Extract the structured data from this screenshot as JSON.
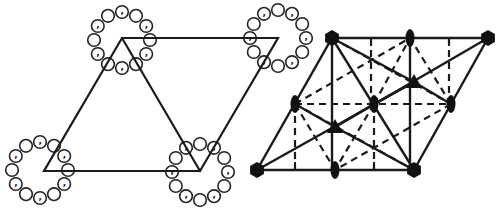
{
  "figure": {
    "left_panel": {
      "title": "",
      "description": "Oblique lattice cell with 6-fold motif rings at each lattice point",
      "vertices": [
        [
          122,
          38
        ],
        [
          278,
          38
        ],
        [
          200,
          171
        ],
        [
          44,
          171
        ]
      ],
      "diagonal": [
        [
          122,
          38
        ],
        [
          200,
          171
        ]
      ],
      "rings": [
        {
          "cx": 122,
          "cy": 40,
          "r": 28,
          "count": 12,
          "comma_positions": [
            0,
            2,
            4,
            6,
            8,
            10
          ]
        },
        {
          "cx": 278,
          "cy": 38,
          "r": 28,
          "count": 12,
          "comma_positions": [
            1,
            3,
            5,
            7,
            9,
            11
          ]
        },
        {
          "cx": 40,
          "cy": 170,
          "r": 28,
          "count": 12,
          "comma_positions": [
            0,
            2,
            4,
            6,
            8,
            10
          ]
        },
        {
          "cx": 200,
          "cy": 172,
          "r": 28,
          "count": 12,
          "comma_positions": [
            1,
            3,
            5,
            7,
            9,
            11
          ]
        }
      ],
      "comma_glyph": ","
    },
    "right_panel": {
      "description": "Symmetry element diagram for hexagonal plane group p6",
      "vertices": [
        [
          332,
          38
        ],
        [
          488,
          38
        ],
        [
          414,
          170
        ],
        [
          257,
          170
        ]
      ],
      "sixfold_axes": [
        [
          332,
          38
        ],
        [
          488,
          38
        ],
        [
          257,
          170
        ],
        [
          414,
          170
        ]
      ],
      "twofold_axes": [
        [
          410,
          38
        ],
        [
          295,
          104
        ],
        [
          374,
          104
        ],
        [
          451,
          104
        ],
        [
          335,
          170
        ]
      ],
      "threefold_axes": [
        [
          414,
          82
        ],
        [
          335,
          127
        ]
      ],
      "symbols": {
        "sixfold": "hexagon",
        "threefold": "triangle",
        "twofold": "ellipse"
      }
    }
  }
}
